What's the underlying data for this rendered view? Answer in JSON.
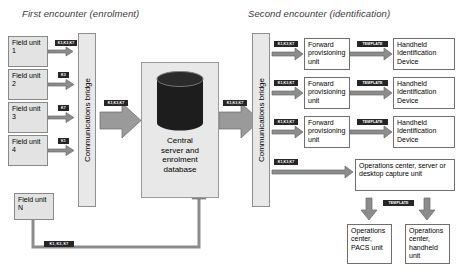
{
  "headings": {
    "left": "First encounter (enrolment)",
    "right": "Second encounter (identification)"
  },
  "field_units": [
    {
      "label": "Field unit 1",
      "badge": "K1,K3,K7"
    },
    {
      "label": "Field unit 2",
      "badge": "K3"
    },
    {
      "label": "Field unit 3",
      "badge": "K7"
    },
    {
      "label": "Field unit 4",
      "badge": "K1"
    }
  ],
  "field_unit_n": {
    "label": "Field unit N",
    "badge": "K1, K3, K7"
  },
  "bridges": {
    "left_label": "Communications bridge",
    "right_label": "Communications bridge"
  },
  "server": {
    "line1": "Central",
    "line2": "server and",
    "line3": "enrolment",
    "line4": "database",
    "inbound_badge": "K1,K3,K7",
    "outbound_badge": "K1,K3,K7"
  },
  "provisioning_rows": [
    {
      "in_badge": "K1,K3,K7",
      "unit": "Forward provisioning unit",
      "out_badge": "TEMPLATE",
      "device": "Handheld Identification Device"
    },
    {
      "in_badge": "K1,K3,K7",
      "unit": "Forward provisioning unit",
      "out_badge": "TEMPLATE",
      "device": "Handheld Identification Device"
    },
    {
      "in_badge": "K1,K3,K7",
      "unit": "Forward provisioning unit",
      "out_badge": "TEMPLATE",
      "device": "Handheld Identification Device"
    }
  ],
  "ops": {
    "in_badge": "K1,K3,K7",
    "capture_unit": "Operations center, server or desktop capture unit",
    "template_badge": "TEMPLATE",
    "pacs_unit": "Operations center, PACS unit",
    "handheld_unit": "Operations center, handheld unit"
  },
  "colors": {
    "panel": "#e8e8e8",
    "badge_bg": "#262626",
    "arrow": "#8c8c8c",
    "cylinder": "#1d1d1d"
  }
}
